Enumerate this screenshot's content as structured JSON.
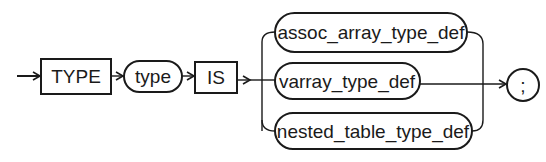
{
  "diagram": {
    "type": "syntax-railroad",
    "nodes": [
      {
        "id": "type_kw",
        "label": "TYPE",
        "shape": "box",
        "kind": "keyword"
      },
      {
        "id": "type_name",
        "label": "type",
        "shape": "pill",
        "kind": "non-terminal"
      },
      {
        "id": "is_kw",
        "label": "IS",
        "shape": "box",
        "kind": "keyword"
      },
      {
        "id": "assoc",
        "label": "assoc_array_type_def",
        "shape": "pill",
        "kind": "non-terminal"
      },
      {
        "id": "varray",
        "label": "varray_type_def",
        "shape": "pill",
        "kind": "non-terminal"
      },
      {
        "id": "nested",
        "label": "nested_table_type_def",
        "shape": "pill",
        "kind": "non-terminal"
      },
      {
        "id": "semicolon",
        "label": ";",
        "shape": "circle",
        "kind": "terminal"
      }
    ],
    "edges": [
      [
        "start",
        "type_kw"
      ],
      [
        "type_kw",
        "type_name"
      ],
      [
        "type_name",
        "is_kw"
      ],
      [
        "is_kw",
        "assoc"
      ],
      [
        "is_kw",
        "varray"
      ],
      [
        "is_kw",
        "nested"
      ],
      [
        "assoc",
        "semicolon"
      ],
      [
        "varray",
        "semicolon"
      ],
      [
        "nested",
        "semicolon"
      ]
    ]
  }
}
